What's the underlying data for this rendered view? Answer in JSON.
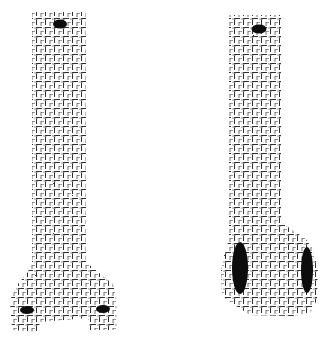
{
  "figure": {
    "background": "#ffffff",
    "ink_color": "#111111",
    "panels": [
      {
        "id": "left",
        "shape": "inverted-T / flared column",
        "grid_pattern": "hand-drawn dashed grid",
        "outline_path": "M32,12 L86,12 L86,262 L98,272 L113,284 L117,300 L117,330 L90,330 L88,318 L40,322 L38,332 L12,330 L10,300 L18,284 L28,272 L32,262 Z",
        "spots": [
          {
            "name": "top-spot",
            "cx": 60,
            "cy": 24,
            "rx": 7,
            "ry": 4.5
          },
          {
            "name": "bottom-left-spot",
            "cx": 27,
            "cy": 310,
            "rx": 7,
            "ry": 4
          },
          {
            "name": "bottom-right-spot",
            "cx": 103,
            "cy": 309,
            "rx": 7,
            "ry": 4
          }
        ]
      },
      {
        "id": "right",
        "shape": "L-shaped / boot column",
        "grid_pattern": "hand-drawn dashed grid",
        "outline_path": "M229,15 L281,15 L281,222 L295,232 L305,238 L312,248 L318,268 L317,300 L310,313 L292,316 L250,315 L236,306 L222,296 L221,270 L226,250 L229,238 Z",
        "spots": [
          {
            "name": "top-spot",
            "cx": 259,
            "cy": 29,
            "rx": 7.5,
            "ry": 4.5
          },
          {
            "name": "large-left-spot",
            "cx": 240,
            "cy": 268,
            "rx": 8,
            "ry": 26
          },
          {
            "name": "large-right-spot",
            "cx": 307,
            "cy": 270,
            "rx": 6,
            "ry": 23
          }
        ]
      }
    ]
  }
}
